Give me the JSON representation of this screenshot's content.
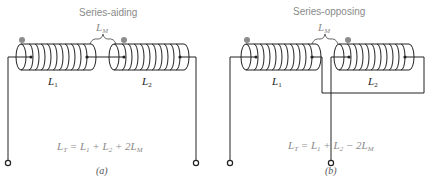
{
  "diagrams": [
    {
      "id": "a",
      "title": "Series-aiding",
      "mutual_label": "L",
      "mutual_sub": "M",
      "coil1": {
        "label": "L",
        "sub": "1"
      },
      "coil2": {
        "label": "L",
        "sub": "2"
      },
      "formula": {
        "lhs": "L",
        "lhs_sub": "T",
        "t1": " = L",
        "t1_sub": "1",
        "t2": " + L",
        "t2_sub": "2",
        "t3": " + 2L",
        "t3_sub": "M"
      },
      "caption": "(a)"
    },
    {
      "id": "b",
      "title": "Series-opposing",
      "mutual_label": "L",
      "mutual_sub": "M",
      "coil1": {
        "label": "L",
        "sub": "1"
      },
      "coil2": {
        "label": "L",
        "sub": "2"
      },
      "formula": {
        "lhs": "L",
        "lhs_sub": "T",
        "t1": " = L",
        "t1_sub": "1",
        "t2": " + L",
        "t2_sub": "2",
        "t3": " − 2L",
        "t3_sub": "M"
      },
      "caption": "(b)"
    }
  ],
  "colors": {
    "wire": "#222222",
    "polarity_dot": "#8c8c8c",
    "label_gray": "#8a8a8a"
  }
}
